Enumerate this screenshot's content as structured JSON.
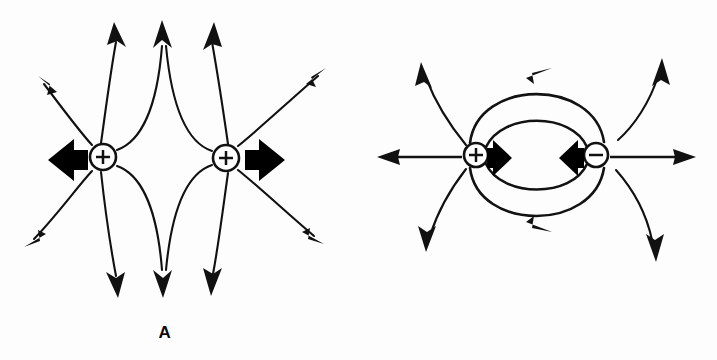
{
  "figure": {
    "background_color": "#ffffff",
    "ink_color": "#111111",
    "width": 717,
    "height": 360
  },
  "panels": [
    {
      "id": "A",
      "label": "A",
      "label_x": 165,
      "label_y": 333,
      "caption": "Like charges: two positive charges repel",
      "interaction": "repulsion",
      "charges": [
        {
          "name": "charge-positive-left",
          "sign": "+",
          "sign_glyph": "+",
          "cx": 103,
          "cy": 157,
          "r": 13
        },
        {
          "name": "charge-positive-right",
          "sign": "+",
          "sign_glyph": "+",
          "cx": 226,
          "cy": 158,
          "r": 13
        }
      ],
      "force_arrows": [
        {
          "name": "force-arrow-left",
          "direction": "left",
          "tip_x": 48,
          "tail_x": 88,
          "cy": 160
        },
        {
          "name": "force-arrow-right",
          "direction": "right",
          "tip_x": 285,
          "tail_x": 243,
          "cy": 160
        }
      ],
      "field_line_count": 16
    },
    {
      "id": "B",
      "label": "B",
      "label_x": 531,
      "label_y": 333,
      "caption": "Opposite charges: a positive and a negative charge attract",
      "interaction": "attraction",
      "charges": [
        {
          "name": "charge-positive",
          "sign": "+",
          "sign_glyph": "+",
          "cx": 476,
          "cy": 155,
          "r": 12
        },
        {
          "name": "charge-negative",
          "sign": "-",
          "sign_glyph": "−",
          "cx": 596,
          "cy": 155,
          "r": 12
        }
      ],
      "force_arrows": [
        {
          "name": "force-arrow-right-inward",
          "direction": "right",
          "tip_x": 512,
          "tail_x": 487,
          "cy": 158
        },
        {
          "name": "force-arrow-left-inward",
          "direction": "left",
          "tip_x": 559,
          "tail_x": 584,
          "cy": 158
        }
      ],
      "connecting_arcs": 4,
      "field_line_count": 7
    }
  ],
  "legend": {
    "positive_symbol": "+",
    "negative_symbol": "−",
    "field_direction_note": "Arrowheads point away from positive charge and toward negative charge",
    "force_note": "Heavy block arrows indicate the Coulomb force on each charge"
  }
}
